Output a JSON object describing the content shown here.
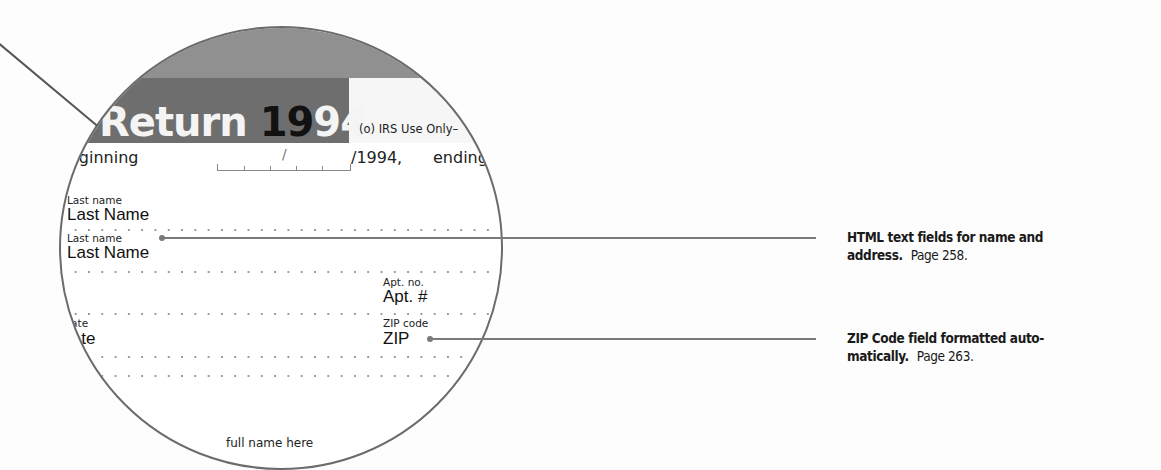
{
  "form_preview": {
    "title_prefix": "Return ",
    "year_black": "19",
    "year_white": "94",
    "irs_use_only": "(o) IRS Use Only–",
    "beginning_label": "eginning",
    "date_slash": "/",
    "year_suffix": "/1994,",
    "ending_label": "ending",
    "fields": [
      {
        "label": "Last name",
        "value": "Last Name"
      },
      {
        "label": "Last name",
        "value": "Last Name"
      },
      {
        "label": "Apt. no.",
        "value": "Apt. #"
      },
      {
        "label": "tate",
        "value": "tate"
      },
      {
        "label": "ZIP code",
        "value": "ZIP"
      }
    ],
    "bottom_text": "full name here"
  },
  "callouts": [
    {
      "bold": "HTML text fields for name and address.",
      "bold_line1": "HTML text fields for name and",
      "bold_line2": "address.",
      "page": "Page 258."
    },
    {
      "bold": "ZIP Code field formatted automatically.",
      "bold_line1": "ZIP Code field formatted auto-",
      "bold_line2": "matically.",
      "page": "Page 263."
    }
  ],
  "colors": {
    "band_light": "#909090",
    "band_dark": "#6e6e6e",
    "lens_border": "#6b6b6b",
    "callout_line": "#7a7a7a"
  }
}
